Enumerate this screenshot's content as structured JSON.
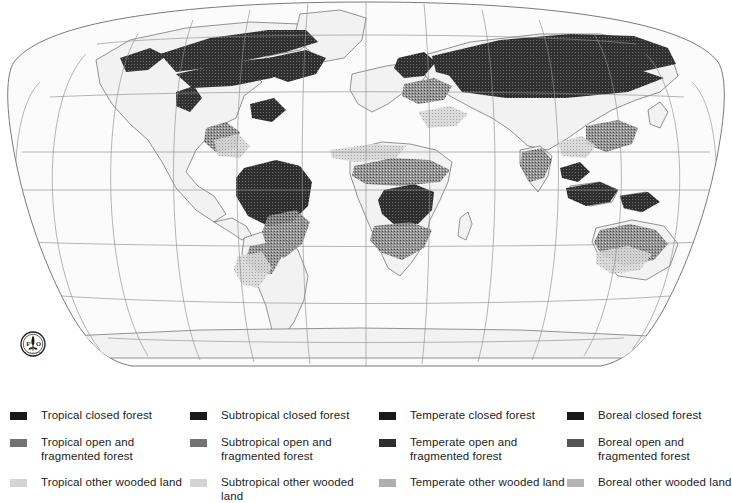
{
  "figure": {
    "type": "thematic-world-map",
    "projection": "Robinson",
    "title": "",
    "attribution_logo": "fao-logo"
  },
  "map": {
    "graticule": {
      "visible": true,
      "meridian_interval_deg": 30,
      "parallel_interval_deg": 30,
      "line_color": "#8c8c8c"
    },
    "ocean_color": "#ffffff",
    "land_color": "#f4f4f4",
    "coastline_color": "#555555",
    "forest_dark": "#1f1f1f",
    "forest_mid": "#6e6e6e",
    "forest_light": "#c9c9c9"
  },
  "logo": {
    "name": "fao-logo",
    "letters": "FAO",
    "motto": "FIAT PANIS"
  },
  "legend": {
    "columns": [
      {
        "domain": "Tropical",
        "items": [
          {
            "label": "Tropical closed forest",
            "color": "#1a1a1a",
            "swatch": "tropical-closed-forest"
          },
          {
            "label": "Tropical open and\nfragmented forest",
            "color": "#737373",
            "swatch": "tropical-open-fragmented-forest"
          },
          {
            "label": "Tropical other wooded land",
            "color": "#d4d4d4",
            "swatch": "tropical-other-wooded-land"
          }
        ]
      },
      {
        "domain": "Subtropical",
        "items": [
          {
            "label": "Subtropical closed forest",
            "color": "#1a1a1a",
            "swatch": "subtropical-closed-forest"
          },
          {
            "label": "Subtropical open and\nfragmented forest",
            "color": "#737373",
            "swatch": "subtropical-open-fragmented-forest"
          },
          {
            "label": "Subtropical other wooded land",
            "color": "#d4d4d4",
            "swatch": "subtropical-other-wooded-land"
          }
        ]
      },
      {
        "domain": "Temperate",
        "items": [
          {
            "label": "Temperate closed forest",
            "color": "#1a1a1a",
            "swatch": "temperate-closed-forest"
          },
          {
            "label": "Temperate open and\nfragmented forest",
            "color": "#2e2e2e",
            "swatch": "temperate-open-fragmented-forest"
          },
          {
            "label": "Temperate other wooded land",
            "color": "#aeaeae",
            "swatch": "temperate-other-wooded-land"
          }
        ]
      },
      {
        "domain": "Boreal",
        "items": [
          {
            "label": "Boreal closed forest",
            "color": "#1a1a1a",
            "swatch": "boreal-closed-forest"
          },
          {
            "label": "Boreal open and\nfragmented forest",
            "color": "#555555",
            "swatch": "boreal-open-fragmented-forest"
          },
          {
            "label": "Boreal other wooded land",
            "color": "#b5b5b5",
            "swatch": "boreal-other-wooded-land"
          }
        ]
      }
    ]
  }
}
